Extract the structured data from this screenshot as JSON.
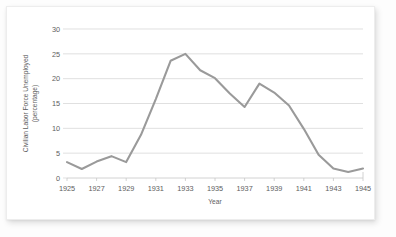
{
  "chart_data": {
    "type": "line",
    "title": "",
    "xlabel": "Year",
    "ylabel": "Civilian Labor Force Unemployed (percentage)",
    "ylabel_line1": "Civilian Labor Force Unemployed",
    "ylabel_line2": "(percentage)",
    "x": [
      1925,
      1926,
      1927,
      1928,
      1929,
      1930,
      1931,
      1932,
      1933,
      1934,
      1935,
      1936,
      1937,
      1938,
      1939,
      1940,
      1941,
      1942,
      1943,
      1944,
      1945
    ],
    "values": [
      3.2,
      1.8,
      3.3,
      4.4,
      3.2,
      8.7,
      15.9,
      23.6,
      25.0,
      21.7,
      20.1,
      17.0,
      14.3,
      19.0,
      17.2,
      14.6,
      9.9,
      4.7,
      1.9,
      1.2,
      1.9
    ],
    "categories": [
      "1925",
      "1926",
      "1927",
      "1928",
      "1929",
      "1930",
      "1931",
      "1932",
      "1933",
      "1934",
      "1935",
      "1936",
      "1937",
      "1938",
      "1939",
      "1940",
      "1941",
      "1942",
      "1943",
      "1944",
      "1945"
    ],
    "xtick_labels": [
      "1925",
      "1927",
      "1929",
      "1931",
      "1933",
      "1935",
      "1937",
      "1939",
      "1941",
      "1943",
      "1945"
    ],
    "xtick_values": [
      1925,
      1927,
      1929,
      1931,
      1933,
      1935,
      1937,
      1939,
      1941,
      1943,
      1945
    ],
    "ytick_labels": [
      "0",
      "5",
      "10",
      "15",
      "20",
      "25",
      "30"
    ],
    "ytick_values": [
      0,
      5,
      10,
      15,
      20,
      25,
      30
    ],
    "xlim": [
      1925,
      1945
    ],
    "ylim": [
      0,
      30
    ],
    "grid": "horizontal",
    "legend": "none",
    "series": [
      {
        "name": "Civilian Labor Force Unemployed",
        "color": "#9a9a9a",
        "values": [
          3.2,
          1.8,
          3.3,
          4.4,
          3.2,
          8.7,
          15.9,
          23.6,
          25.0,
          21.7,
          20.1,
          17.0,
          14.3,
          19.0,
          17.2,
          14.6,
          9.9,
          4.7,
          1.9,
          1.2,
          1.9
        ]
      }
    ]
  },
  "style": {
    "line_color": "#9a9a9a",
    "grid_color": "#d2d2d2",
    "axis_color": "#c6c6c6",
    "text_color": "#5e5e5e",
    "card_background": "#ffffff",
    "page_background": "#fdfdfd"
  }
}
